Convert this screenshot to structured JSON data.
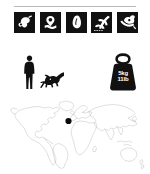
{
  "sheet": {
    "title": "Dinosaur fact sheet",
    "background_color": "#ffffff",
    "ink_color": "#111111",
    "divider_color": "#b9b9b9"
  },
  "divider": {
    "label": "section divider"
  },
  "trait_icons": {
    "label": "Dinosaur trait icon strip",
    "count": 5,
    "items": [
      {
        "name": "diet-meat-icon",
        "label": "Diet: carnivore (meat)",
        "style": "white-on-black-square"
      },
      {
        "name": "habitat-icon",
        "label": "Habitat / terrain",
        "style": "white-on-black-square"
      },
      {
        "name": "egg-nest-icon",
        "label": "Eggs / reproduction",
        "style": "white-on-black-square"
      },
      {
        "name": "fossil-site-icon",
        "label": "Fossil find site",
        "style": "white-on-black-square"
      },
      {
        "name": "excavation-icon",
        "label": "Excavation / dig",
        "style": "white-on-black-square"
      }
    ]
  },
  "scale": {
    "label": "Size comparison with human",
    "human": {
      "name": "human-silhouette",
      "label": "Human silhouette (scale reference)"
    },
    "dinosaur": {
      "name": "dinosaur-silhouette",
      "label": "Dinosaur silhouette (to scale)"
    }
  },
  "weight": {
    "label": "Estimated body mass",
    "icon": "weight-kettlebell-icon",
    "metric": "5kg",
    "imperial": "11lb"
  },
  "map": {
    "label": "World distribution map",
    "outline_color": "#8d8d8d",
    "marker": {
      "name": "fossil-location-marker",
      "label": "Fossil location marker",
      "color": "#0a0a0a",
      "x_pct": 44.5,
      "y_pct": 33.0
    }
  }
}
